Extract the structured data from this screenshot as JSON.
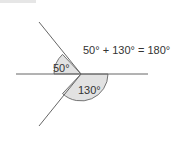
{
  "diagram": {
    "equation": "50° + 130° = 180°",
    "angles": [
      {
        "label": "50°",
        "degrees": 50
      },
      {
        "label": "130°",
        "degrees": 130
      }
    ],
    "colors": {
      "line": "#555555",
      "arc_fill": "#e2e2e2",
      "text": "#333333"
    }
  }
}
